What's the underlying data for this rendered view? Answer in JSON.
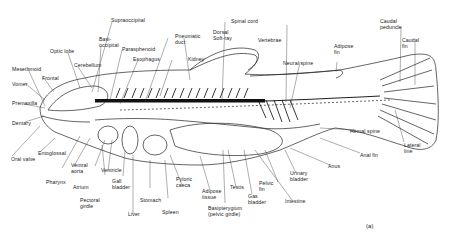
{
  "figure": {
    "panel_label": "(a)"
  },
  "labels": {
    "supraoccipital": "Supraoccipital",
    "basioccipital": "Basi-\noccipital",
    "parasphenoid": "Parasphenoid",
    "optic_lobe": "Optic lobe",
    "cerebellum": "Cerebellum",
    "esophagus": "Esophagus",
    "pneumatic_duct": "Pneumatic\nduct",
    "kidney": "Kidney",
    "dorsal_soft_ray": "Dorsal\nSoft-ray",
    "spinal_cord": "Spinal cord",
    "vertebrae": "Vertebrae",
    "neural_spine": "Neural spine",
    "adipose_fin": "Adipose\nfin",
    "caudal_peduncle": "Caudal\npeduncle",
    "caudal_fin": "Caudal\nfin",
    "mesethmoid": "Mesethmoid",
    "frontal": "Frontal",
    "vomer": "Vomer",
    "premaxilla": "Premaxilla",
    "dentary": "Dentary",
    "oral_valve": "Oral valve",
    "entoglossal": "Entoglossal",
    "pharynx": "Pharynx",
    "ventral_aorta": "Ventral\naorta",
    "atrium": "Atrium",
    "ventricle": "Ventricle",
    "pectoral_girdle": "Pectoral\ngirdle",
    "gall_bladder_1": "Gall\nbladder",
    "liver": "Liver",
    "stomach": "Stomach",
    "spleen": "Spleen",
    "pyloric_caeca": "Pyloric\ncaeca",
    "adipose_tissue": "Adipose\ntissue",
    "testis": "Testis",
    "basipterygium": "Basipterygium\n(pelvic girdle)",
    "gas_bladder": "Gas\nbladder",
    "pelvic_fin": "Pelvic\nfin",
    "intestine": "Intestine",
    "urinary_bladder": "Urinary\nbladder",
    "anus": "Anus",
    "anal_fin": "Anal fin",
    "hemal_spine": "Hemal spine",
    "lateral_line": "Lateral\nline"
  }
}
